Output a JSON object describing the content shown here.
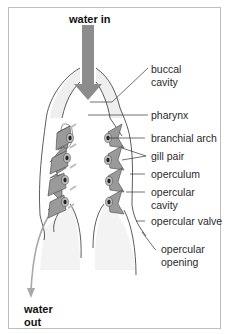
{
  "diagram": {
    "title_in": "water in",
    "title_out_line1": "water",
    "title_out_line2": "out",
    "labels": {
      "buccal_1": "buccal",
      "buccal_2": "cavity",
      "pharynx": "pharynx",
      "branchial_arch": "branchial arch",
      "gill_pair": "gill pair",
      "operculum": "operculum",
      "opercular_cavity_1": "opercular",
      "opercular_cavity_2": "cavity",
      "opercular_valve": "opercular valve",
      "opercular_opening_1": "opercular",
      "opercular_opening_2": "opening"
    },
    "colors": {
      "arrow": "#8c8c8c",
      "gill": "#9a9a9a",
      "outline": "#333333",
      "fill": "#efefef",
      "border": "#bdbdbd"
    }
  }
}
